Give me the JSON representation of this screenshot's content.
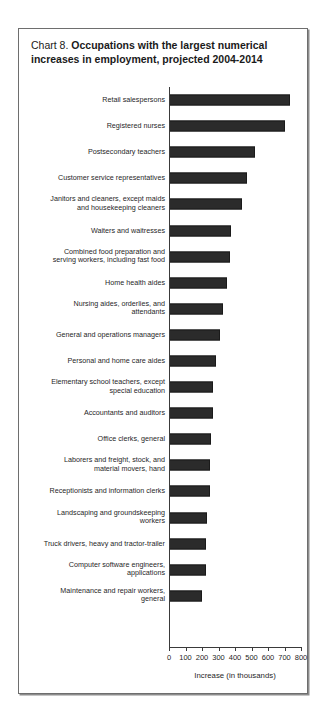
{
  "chart_data": {
    "type": "bar",
    "orientation": "horizontal",
    "title": "Chart 8.  Occupations with the largest numerical increases in employment, projected 2004-2014",
    "title_lead": "Chart 8.",
    "title_bold": "Occupations with the largest numerical increases in employment, projected 2004-2014",
    "title_line1": "Occupations with the largest numerical",
    "title_line2": "increases in employment, projected 2004-2014",
    "xlabel": "Increase (in thousands)",
    "ylabel": "",
    "xlim": [
      0,
      800
    ],
    "xticks": [
      0,
      100,
      200,
      300,
      400,
      500,
      600,
      700,
      800
    ],
    "xtick_labels": [
      "0",
      "100",
      "200",
      "300",
      "400",
      "500",
      "600",
      "700",
      "800"
    ],
    "grid": false,
    "legend": false,
    "bar_color": "#2b2b2b",
    "categories": [
      "Retail salespersons",
      "Registered nurses",
      "Postsecondary teachers",
      "Customer service representatives",
      "Janitors and cleaners, except maids\nand housekeeping cleaners",
      "Waiters and waitresses",
      "Combined food preparation and\nserving workers, including fast food",
      "Home health aides",
      "Nursing aides, orderlies, and\nattendants",
      "General and operations managers",
      "Personal and home care aides",
      "Elementary school teachers, except\nspecial education",
      "Accountants and auditors",
      "Office clerks, general",
      "Laborers and freight, stock, and\nmaterial movers, hand",
      "Receptionists and information clerks",
      "Landscaping and groundskeeping\nworkers",
      "Truck drivers, heavy and tractor-trailer",
      "Computer software engineers,\napplications",
      "Maintenance and repair workers,\ngeneral"
    ],
    "values": [
      736,
      703,
      524,
      471,
      440,
      376,
      367,
      350,
      325,
      308,
      287,
      265,
      264,
      256,
      249,
      246,
      230,
      223,
      222,
      202
    ]
  }
}
